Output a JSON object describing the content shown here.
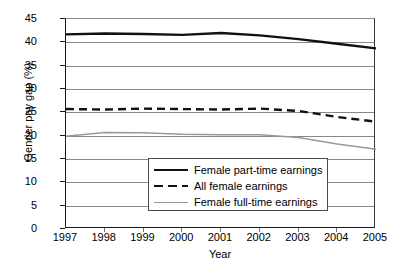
{
  "chart_data": {
    "type": "line",
    "title": "",
    "xlabel": "Year",
    "ylabel": "Gender pay gap (%)",
    "x": [
      1997,
      1998,
      1999,
      2000,
      2001,
      2002,
      2003,
      2004,
      2005
    ],
    "xtick_labels": [
      "1997",
      "1998",
      "1999",
      "2000",
      "2001",
      "2002",
      "2003",
      "2004",
      "2005"
    ],
    "ytick_labels": [
      "0",
      "5",
      "10",
      "15",
      "20",
      "25",
      "30",
      "35",
      "40",
      "45"
    ],
    "ylim": [
      0,
      45
    ],
    "ytick_step": 5,
    "grid": "horizontal",
    "legend_position": "inside-bottom-center",
    "series": [
      {
        "name": "Female part-time earnings",
        "style": "solid",
        "color": "#111111",
        "width": 2.4,
        "values": [
          41.7,
          41.9,
          41.8,
          41.6,
          42.0,
          41.5,
          40.7,
          39.7,
          38.7
        ]
      },
      {
        "name": "All female earnings",
        "style": "dashed",
        "color": "#111111",
        "width": 2.4,
        "values": [
          25.7,
          25.6,
          25.8,
          25.7,
          25.6,
          25.8,
          25.3,
          24.0,
          23.0
        ]
      },
      {
        "name": "Female full-time earnings",
        "style": "solid",
        "color": "#999999",
        "width": 1.5,
        "values": [
          19.9,
          20.7,
          20.6,
          20.3,
          20.2,
          20.2,
          19.6,
          18.2,
          17.1
        ]
      }
    ]
  },
  "axes": {
    "frame_color": "#1a1a1a",
    "gridline_color": "#888888"
  }
}
